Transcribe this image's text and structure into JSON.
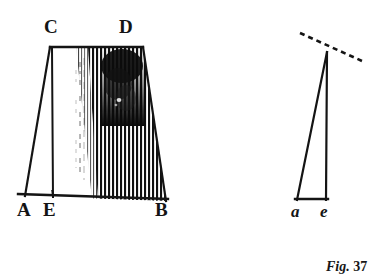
{
  "figure": {
    "caption_prefix": "Fig.",
    "caption_number": "37",
    "background_color": "#ffffff",
    "ink_color": "#141414",
    "left_diagram": {
      "name": "shaded-trapezoid",
      "vertex_labels": {
        "top_left": "C",
        "top_right": "D",
        "bottom_left": "A",
        "bottom_mid": "E",
        "bottom_right": "B"
      },
      "vertices": {
        "C": [
          50,
          47
        ],
        "D": [
          143,
          47
        ],
        "A": [
          25,
          196
        ],
        "E": [
          52,
          197
        ],
        "B": [
          166,
          201
        ]
      },
      "shading": {
        "style": "vertical-hatching",
        "darkest_region": "upper-right",
        "fade_direction": "right-to-left"
      }
    },
    "right_diagram": {
      "name": "narrow-triangle",
      "vertex_labels": {
        "bottom_left": "a",
        "bottom_right": "e"
      },
      "vertices": {
        "apex": [
          327,
          52
        ],
        "a": [
          297,
          200
        ],
        "e": [
          326,
          200
        ]
      },
      "dashed_line": {
        "from": [
          300,
          33
        ],
        "to": [
          362,
          61
        ],
        "style": "dashed"
      }
    }
  }
}
